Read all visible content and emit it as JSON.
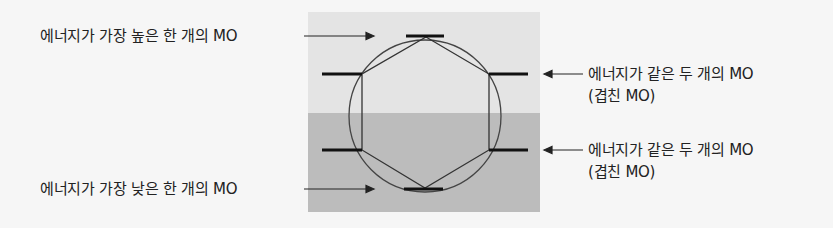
{
  "diagram": {
    "colors": {
      "background": "#f6f6f6",
      "upper_region": "#e4e4e4",
      "lower_region": "#bcbcbc",
      "lines": "#333333"
    },
    "labels": {
      "highest": "에너지가 가장 높은 한 개의 MO",
      "lowest": "에너지가 가장 낮은 한 개의 MO",
      "upper_degenerate_line1": "에너지가 같은 두 개의 MO",
      "upper_degenerate_line2": "(겹친 MO)",
      "lower_degenerate_line1": "에너지가 같은 두 개의 MO",
      "lower_degenerate_line2": "(겹친 MO)"
    },
    "energy_levels": [
      {
        "level": "highest",
        "count": 1
      },
      {
        "level": "upper-degenerate",
        "count": 2
      },
      {
        "level": "lower-degenerate",
        "count": 2
      },
      {
        "level": "lowest",
        "count": 1
      }
    ]
  }
}
